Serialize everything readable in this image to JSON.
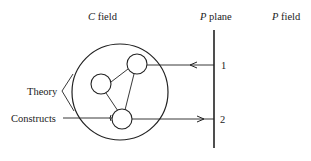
{
  "labels": {
    "c_field_letter": "C",
    "c_field_word": " field",
    "p_plane_letter": "P",
    "p_plane_word": " plane",
    "p_field_letter": "P",
    "p_field_word": " field",
    "theory": "Theory",
    "constructs": "Constructs",
    "point_1": "1",
    "point_2": "2"
  },
  "colors": {
    "stroke": "#222222",
    "background": "#ffffff"
  }
}
